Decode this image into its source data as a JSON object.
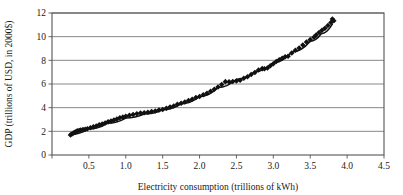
{
  "figure": {
    "background_color": "#ffffff",
    "frame_color": "#555555",
    "grid_color": "#7a7a7a",
    "marker_color": "#111111",
    "line_color": "#111111"
  },
  "chart_data": {
    "type": "scatter",
    "title": "",
    "subtitle": "",
    "xlabel": "Electricity consumption (trillions of kWh)",
    "ylabel": "GDP (trillions of USD, in 2000$)",
    "xlim": [
      0,
      4.5
    ],
    "ylim": [
      0,
      12
    ],
    "xticks": [
      0,
      0.5,
      1.0,
      1.5,
      2.0,
      2.5,
      3.0,
      3.5,
      4.0,
      4.5
    ],
    "xtick_labels": [
      "0",
      "0.5",
      "1.0",
      "1.5",
      "2.0",
      "2.5",
      "3.0",
      "3.5",
      "4.0",
      "4.5"
    ],
    "yticks": [
      0,
      2,
      4,
      6,
      8,
      10,
      12
    ],
    "ytick_labels": [
      "0",
      "2",
      "4",
      "6",
      "8",
      "10",
      "12"
    ],
    "grid": "horizontal",
    "legend": "none",
    "marker": "diamond",
    "marker_size": 3,
    "annotations": [],
    "series": [
      {
        "name": "GDP vs electricity consumption",
        "kind": "scatter",
        "points": [
          [
            0.25,
            1.7
          ],
          [
            0.27,
            1.78
          ],
          [
            0.29,
            1.85
          ],
          [
            0.31,
            1.93
          ],
          [
            0.33,
            2.0
          ],
          [
            0.35,
            2.05
          ],
          [
            0.37,
            2.08
          ],
          [
            0.39,
            2.12
          ],
          [
            0.42,
            2.15
          ],
          [
            0.45,
            2.18
          ],
          [
            0.48,
            2.22
          ],
          [
            0.52,
            2.3
          ],
          [
            0.56,
            2.38
          ],
          [
            0.6,
            2.45
          ],
          [
            0.64,
            2.55
          ],
          [
            0.68,
            2.62
          ],
          [
            0.72,
            2.7
          ],
          [
            0.76,
            2.8
          ],
          [
            0.8,
            2.88
          ],
          [
            0.84,
            2.95
          ],
          [
            0.88,
            3.05
          ],
          [
            0.92,
            3.15
          ],
          [
            0.96,
            3.2
          ],
          [
            1.0,
            3.28
          ],
          [
            1.05,
            3.35
          ],
          [
            1.1,
            3.42
          ],
          [
            1.15,
            3.48
          ],
          [
            1.2,
            3.55
          ],
          [
            1.25,
            3.58
          ],
          [
            1.3,
            3.62
          ],
          [
            1.35,
            3.68
          ],
          [
            1.4,
            3.72
          ],
          [
            1.45,
            3.8
          ],
          [
            1.5,
            3.85
          ],
          [
            1.55,
            3.95
          ],
          [
            1.6,
            4.05
          ],
          [
            1.65,
            4.15
          ],
          [
            1.7,
            4.28
          ],
          [
            1.75,
            4.38
          ],
          [
            1.8,
            4.48
          ],
          [
            1.85,
            4.6
          ],
          [
            1.9,
            4.72
          ],
          [
            1.95,
            4.85
          ],
          [
            2.0,
            4.95
          ],
          [
            2.05,
            5.1
          ],
          [
            2.1,
            5.22
          ],
          [
            2.15,
            5.38
          ],
          [
            2.2,
            5.55
          ],
          [
            2.25,
            5.75
          ],
          [
            2.3,
            5.95
          ],
          [
            2.35,
            6.2
          ],
          [
            2.4,
            6.18
          ],
          [
            2.45,
            6.22
          ],
          [
            2.5,
            6.25
          ],
          [
            2.55,
            6.32
          ],
          [
            2.6,
            6.48
          ],
          [
            2.65,
            6.62
          ],
          [
            2.7,
            6.8
          ],
          [
            2.75,
            6.98
          ],
          [
            2.8,
            7.18
          ],
          [
            2.85,
            7.3
          ],
          [
            2.88,
            7.28
          ],
          [
            2.92,
            7.35
          ],
          [
            2.96,
            7.55
          ],
          [
            3.0,
            7.72
          ],
          [
            3.04,
            7.9
          ],
          [
            3.08,
            8.05
          ],
          [
            3.12,
            8.18
          ],
          [
            3.16,
            8.3
          ],
          [
            3.2,
            8.35
          ],
          [
            3.25,
            8.62
          ],
          [
            3.3,
            8.85
          ],
          [
            3.35,
            9.05
          ],
          [
            3.4,
            9.3
          ],
          [
            3.45,
            9.55
          ],
          [
            3.5,
            9.75
          ],
          [
            3.55,
            9.95
          ],
          [
            3.58,
            10.15
          ],
          [
            3.62,
            10.35
          ],
          [
            3.66,
            10.55
          ],
          [
            3.7,
            10.72
          ],
          [
            3.74,
            10.95
          ],
          [
            3.78,
            11.2
          ],
          [
            3.8,
            11.5
          ],
          [
            3.82,
            11.35
          ]
        ]
      },
      {
        "name": "Fitted trend line",
        "kind": "line",
        "points": [
          [
            0.25,
            1.72
          ],
          [
            0.5,
            2.2
          ],
          [
            0.75,
            2.68
          ],
          [
            1.0,
            3.12
          ],
          [
            1.25,
            3.46
          ],
          [
            1.5,
            3.82
          ],
          [
            1.75,
            4.32
          ],
          [
            2.0,
            4.92
          ],
          [
            2.25,
            5.7
          ],
          [
            2.5,
            6.4
          ],
          [
            2.75,
            7.05
          ],
          [
            3.0,
            7.8
          ],
          [
            3.25,
            8.7
          ],
          [
            3.5,
            9.62
          ],
          [
            3.65,
            10.25
          ],
          [
            3.8,
            11.05
          ]
        ]
      }
    ]
  }
}
